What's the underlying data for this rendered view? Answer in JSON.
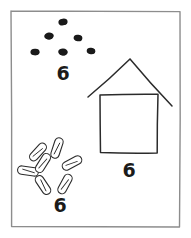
{
  "page": {
    "width": 191,
    "height": 238,
    "background_color": "#ffffff",
    "ink_color": "#2b2b2b",
    "dot_color": "#1a1a1a",
    "numeral_color": "#1b1b1b"
  },
  "frame": {
    "name": "page-border",
    "x": 11,
    "y": 11,
    "width": 169,
    "height": 216,
    "stroke_color": "#8d8d8d",
    "stroke_width": 1.4
  },
  "groups": [
    {
      "id": "dot-group",
      "label": "dots",
      "count_label": "6",
      "count_value": 6,
      "label_x": 63,
      "label_y": 80,
      "items": [
        {
          "cx": 63,
          "cy": 22,
          "rx": 4.6,
          "ry": 3.4,
          "rot": -8
        },
        {
          "cx": 49,
          "cy": 36,
          "rx": 4.8,
          "ry": 3.5,
          "rot": -6
        },
        {
          "cx": 78,
          "cy": 38,
          "rx": 4.4,
          "ry": 3.2,
          "rot": 10
        },
        {
          "cx": 35,
          "cy": 52,
          "rx": 4.6,
          "ry": 3.3,
          "rot": -4
        },
        {
          "cx": 63,
          "cy": 52,
          "rx": 4.8,
          "ry": 3.5,
          "rot": 3
        },
        {
          "cx": 91,
          "cy": 51,
          "rx": 4.3,
          "ry": 3.2,
          "rot": 6
        }
      ]
    },
    {
      "id": "house-group",
      "label": "house",
      "count_label": "6",
      "count_value": 6,
      "label_x": 129,
      "label_y": 177,
      "body": {
        "x": 100,
        "y": 95,
        "width": 58,
        "height": 58
      },
      "roof": {
        "apex_x": 130,
        "apex_y": 59,
        "left_x": 88,
        "left_y": 97,
        "right_x": 172,
        "right_y": 106
      }
    },
    {
      "id": "seed-group",
      "label": "seeds",
      "count_label": "6",
      "count_value": 6,
      "label_x": 60,
      "label_y": 212,
      "center_x": 52,
      "center_y": 165,
      "items": [
        {
          "cx": 57,
          "cy": 148,
          "rx": 10.5,
          "ry": 4.2,
          "rot": 108
        },
        {
          "cx": 38,
          "cy": 152,
          "rx": 10.5,
          "ry": 4.2,
          "rot": 132
        },
        {
          "cx": 28,
          "cy": 171,
          "rx": 10.5,
          "ry": 4.2,
          "rot": 8
        },
        {
          "cx": 43,
          "cy": 185,
          "rx": 10.5,
          "ry": 4.2,
          "rot": 56
        },
        {
          "cx": 65,
          "cy": 184,
          "rx": 10.5,
          "ry": 4.2,
          "rot": 118
        },
        {
          "cx": 72,
          "cy": 163,
          "rx": 10.5,
          "ry": 4.2,
          "rot": 152
        },
        {
          "cx": 43,
          "cy": 163,
          "rx": 10.5,
          "ry": 4.2,
          "rot": 122
        }
      ]
    }
  ]
}
